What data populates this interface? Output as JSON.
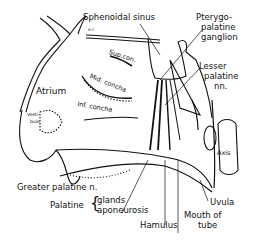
{
  "diagram": {
    "type": "anatomical-illustration",
    "labels": {
      "sphenoidal_sinus": "Sphenoidal sinus",
      "pterygo_1": "Pterygo-",
      "pterygo_2": "palatine",
      "pterygo_3": "ganglion",
      "er": "e.r.",
      "sup_concha": "Sup.con.",
      "lesser_1": "Lesser",
      "lesser_2": "palatine",
      "lesser_3": "nn.",
      "mid_concha": "Mid. concha",
      "atrium": "Atrium",
      "inf_concha": "Inf. concha",
      "vestibule_1": "Vesti-",
      "vestibule_2": "bule",
      "axis": "Axis",
      "uvula": "Uvula",
      "greater_palatine": "Greater palatine n.",
      "palatine": "Palatine",
      "glands": "glands",
      "aponeurosis": "aponeurosis",
      "hamulus": "Hamulus",
      "mouth_1": "Mouth of",
      "mouth_2": "tube"
    }
  }
}
